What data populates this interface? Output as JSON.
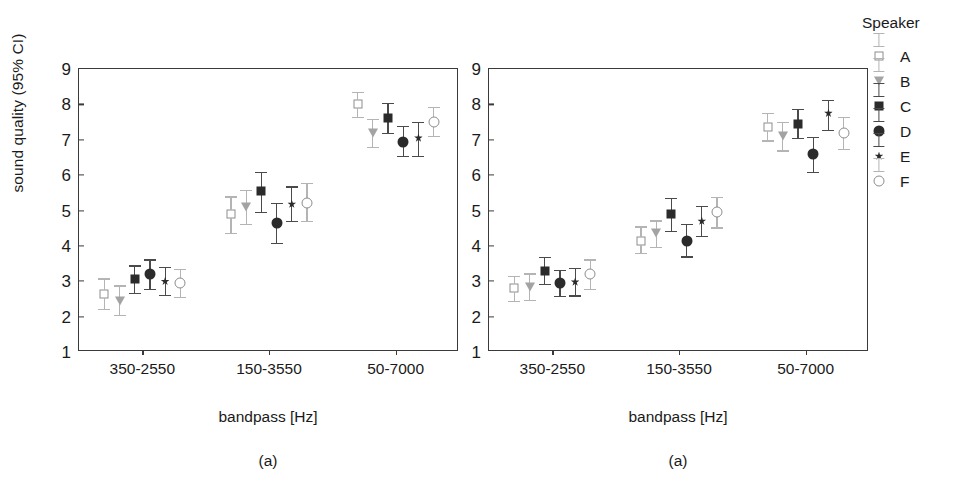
{
  "chart_data": [
    {
      "type": "scatter",
      "panel_id": "a-left",
      "title": "",
      "caption": "(a)",
      "xlabel": "bandpass [Hz]",
      "ylabel": "sound quality (95% CI)",
      "categories": [
        "350-2550",
        "150-3550",
        "50-7000"
      ],
      "ylim": [
        1,
        9
      ],
      "yticks": [
        "1",
        "2",
        "3",
        "4",
        "5",
        "6",
        "7",
        "8",
        "9"
      ],
      "grid": false,
      "legend_position": "right-outside",
      "errorbar_type": "95% CI",
      "series": [
        {
          "name": "A",
          "marker": "open-square",
          "values": [
            2.65,
            4.9,
            8.0
          ],
          "ci_low": [
            2.22,
            4.36,
            7.65
          ],
          "ci_high": [
            3.08,
            5.4,
            8.35
          ]
        },
        {
          "name": "B",
          "marker": "open-triangle",
          "values": [
            2.45,
            5.1,
            7.2
          ],
          "ci_low": [
            2.05,
            4.62,
            6.8
          ],
          "ci_high": [
            2.88,
            5.58,
            7.6
          ]
        },
        {
          "name": "C",
          "marker": "filled-square",
          "values": [
            3.05,
            5.55,
            7.62
          ],
          "ci_low": [
            2.68,
            4.95,
            7.2
          ],
          "ci_high": [
            3.45,
            6.1,
            8.05
          ]
        },
        {
          "name": "D",
          "marker": "filled-circle",
          "values": [
            3.2,
            4.65,
            6.95
          ],
          "ci_low": [
            2.78,
            4.08,
            6.55
          ],
          "ci_high": [
            3.62,
            5.22,
            7.38
          ]
        },
        {
          "name": "E",
          "marker": "asterisk",
          "values": [
            3.0,
            5.18,
            7.05
          ],
          "ci_low": [
            2.62,
            4.7,
            6.55
          ],
          "ci_high": [
            3.4,
            5.68,
            7.5
          ]
        },
        {
          "name": "F",
          "marker": "open-circle",
          "values": [
            2.95,
            5.22,
            7.5
          ],
          "ci_low": [
            2.55,
            4.7,
            7.1
          ],
          "ci_high": [
            3.35,
            5.78,
            7.92
          ]
        }
      ]
    },
    {
      "type": "scatter",
      "panel_id": "a-right",
      "title": "",
      "caption": "(a)",
      "xlabel": "bandpass [Hz]",
      "ylabel": "sound quality (95% CI)",
      "categories": [
        "350-2550",
        "150-3550",
        "50-7000"
      ],
      "ylim": [
        1,
        9
      ],
      "yticks": [
        "1",
        "2",
        "3",
        "4",
        "5",
        "6",
        "7",
        "8",
        "9"
      ],
      "grid": false,
      "legend_position": "right-outside",
      "errorbar_type": "95% CI",
      "series": [
        {
          "name": "A",
          "marker": "open-square",
          "values": [
            2.8,
            4.15,
            7.35
          ],
          "ci_low": [
            2.45,
            3.8,
            6.98
          ],
          "ci_high": [
            3.15,
            4.55,
            7.75
          ]
        },
        {
          "name": "B",
          "marker": "open-triangle",
          "values": [
            2.85,
            4.35,
            7.1
          ],
          "ci_low": [
            2.48,
            3.98,
            6.7
          ],
          "ci_high": [
            3.22,
            4.72,
            7.5
          ]
        },
        {
          "name": "C",
          "marker": "filled-square",
          "values": [
            3.3,
            4.9,
            7.45
          ],
          "ci_low": [
            2.92,
            4.42,
            7.05
          ],
          "ci_high": [
            3.68,
            5.35,
            7.88
          ]
        },
        {
          "name": "D",
          "marker": "filled-circle",
          "values": [
            2.95,
            4.15,
            6.6
          ],
          "ci_low": [
            2.58,
            3.7,
            6.1
          ],
          "ci_high": [
            3.32,
            4.62,
            7.08
          ]
        },
        {
          "name": "E",
          "marker": "asterisk",
          "values": [
            2.98,
            4.7,
            7.75
          ],
          "ci_low": [
            2.6,
            4.28,
            7.28
          ],
          "ci_high": [
            3.38,
            5.12,
            8.12
          ]
        },
        {
          "name": "F",
          "marker": "open-circle",
          "values": [
            3.2,
            4.95,
            7.2
          ],
          "ci_low": [
            2.78,
            4.52,
            6.75
          ],
          "ci_high": [
            3.62,
            5.38,
            7.65
          ]
        }
      ]
    }
  ],
  "legend": {
    "title": "Speaker",
    "items": [
      {
        "label": "A",
        "marker": "open-square"
      },
      {
        "label": "B",
        "marker": "open-triangle"
      },
      {
        "label": "C",
        "marker": "filled-square"
      },
      {
        "label": "D",
        "marker": "filled-circle"
      },
      {
        "label": "E",
        "marker": "asterisk"
      },
      {
        "label": "F",
        "marker": "open-circle"
      }
    ]
  },
  "colors": {
    "axis": "#3a3a3a",
    "dark_marker": "#2b2b2b",
    "light_marker": "#8d8d8d",
    "dark_errorbar": "#4a4a4a",
    "light_errorbar": "#b4b4b4",
    "background": "#ffffff"
  }
}
